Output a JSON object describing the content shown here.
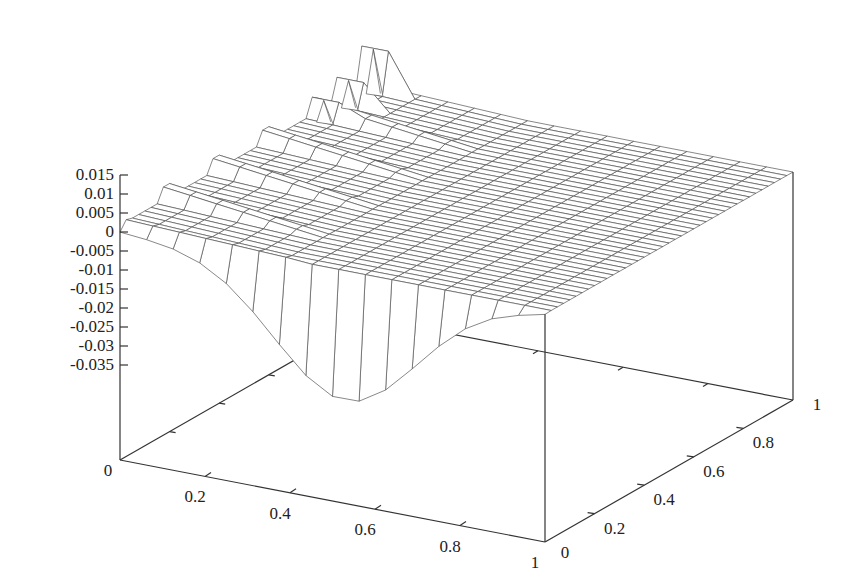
{
  "chart_data": {
    "type": "surface3d",
    "title": "",
    "xlabel": "",
    "ylabel": "",
    "zlabel": "",
    "xlim": [
      0,
      1
    ],
    "ylim": [
      0,
      1
    ],
    "zlim": [
      -0.04,
      0.015
    ],
    "grid": false,
    "legend": "none",
    "x_ticks": [
      "0",
      "0.2",
      "0.4",
      "0.6",
      "0.8",
      "1"
    ],
    "y_ticks": [
      "0",
      "0.2",
      "0.4",
      "0.6",
      "0.8",
      "1"
    ],
    "z_ticks": [
      "0.015",
      "0.01",
      "0.005",
      "0",
      "-0.005",
      "-0.01",
      "-0.015",
      "-0.02",
      "-0.025",
      "-0.03",
      "-0.035"
    ],
    "z_tick_values": [
      0.015,
      0.01,
      0.005,
      0,
      -0.005,
      -0.01,
      -0.015,
      -0.02,
      -0.025,
      -0.03,
      -0.035
    ],
    "x_tick_values": [
      0,
      0.2,
      0.4,
      0.6,
      0.8,
      1
    ],
    "y_tick_values": [
      0,
      0.2,
      0.4,
      0.6,
      0.8,
      1
    ],
    "surface": {
      "nx": 16,
      "ny": 40,
      "description": "Mostly flat surface at z≈0; the y=0 edge dips to about -0.033 near x≈0.53; small stepped ridges (+0.003..0.006) for x<0.35; three narrow spikes near x≈0.03 at high y",
      "front_dip_min": -0.033,
      "front_dip_center_x": 0.53,
      "spikes": [
        {
          "x": 0.03,
          "y": 0.97,
          "z": 0.0125
        },
        {
          "x": 0.03,
          "y": 0.87,
          "z": 0.008
        },
        {
          "x": 0.03,
          "y": 0.77,
          "z": 0.0065
        }
      ]
    }
  }
}
